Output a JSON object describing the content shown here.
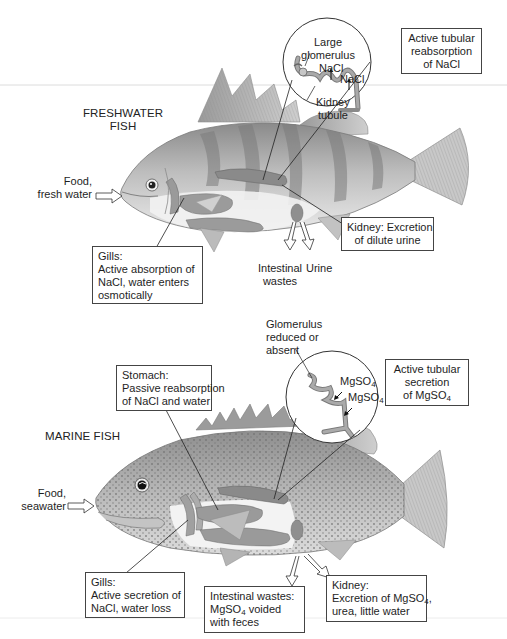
{
  "freshwater": {
    "title_line1": "FRESHWATER",
    "title_line2": "FISH",
    "food_line1": "Food,",
    "food_line2": "fresh water",
    "inset": {
      "large_line1": "Large",
      "large_line2": "glomerulus",
      "nacl_1": "NaCl",
      "nacl_2": "NaCl",
      "kidney_line1": "Kidney",
      "kidney_line2": "tubule"
    },
    "reabsorption_box": {
      "line1": "Active tubular",
      "line2": "reabsorption",
      "line3": "of NaCl"
    },
    "gills_box": {
      "line1": "Gills:",
      "line2": "Active absorption of",
      "line3": "NaCl, water enters",
      "line4": "osmotically"
    },
    "kidney_box": {
      "line1": "Kidney: Excretion",
      "line2": "of dilute urine"
    },
    "intestinal_line1": "Intestinal",
    "intestinal_line2": "wastes",
    "urine": "Urine"
  },
  "marine": {
    "title": "MARINE FISH",
    "food_line1": "Food,",
    "food_line2": "seawater",
    "glomerulus_line1": "Glomerulus",
    "glomerulus_line2": "reduced or",
    "glomerulus_line3": "absent",
    "inset": {
      "mgso4_1_base": "MgSO",
      "mgso4_1_sub": "4",
      "mgso4_2_base": "MgSO",
      "mgso4_2_sub": "4"
    },
    "secretion_box": {
      "line1": "Active tubular",
      "line2": "secretion",
      "line3_base": "of MgSO",
      "line3_sub": "4"
    },
    "stomach_box": {
      "line1": "Stomach:",
      "line2": "Passive reabsorption",
      "line3": "of NaCl and water"
    },
    "gills_box": {
      "line1": "Gills:",
      "line2": "Active secretion of",
      "line3": "NaCl, water loss"
    },
    "intestinal_box": {
      "line1": "Intestinal wastes:",
      "line2_base": "MgSO",
      "line2_sub": "4",
      "line2_rest": " voided",
      "line3": "with feces"
    },
    "kidney_box": {
      "line1": "Kidney:",
      "line2_base": "Excretion of MgSO",
      "line2_sub": "4",
      "line2_rest": ",",
      "line3": "urea, little water"
    }
  },
  "colors": {
    "ink": "#1e1e1e",
    "fish_body": "#b9b9b9",
    "fish_dark": "#7d7d7d",
    "organ": "#8e8e8e",
    "belly": "#ececec"
  }
}
